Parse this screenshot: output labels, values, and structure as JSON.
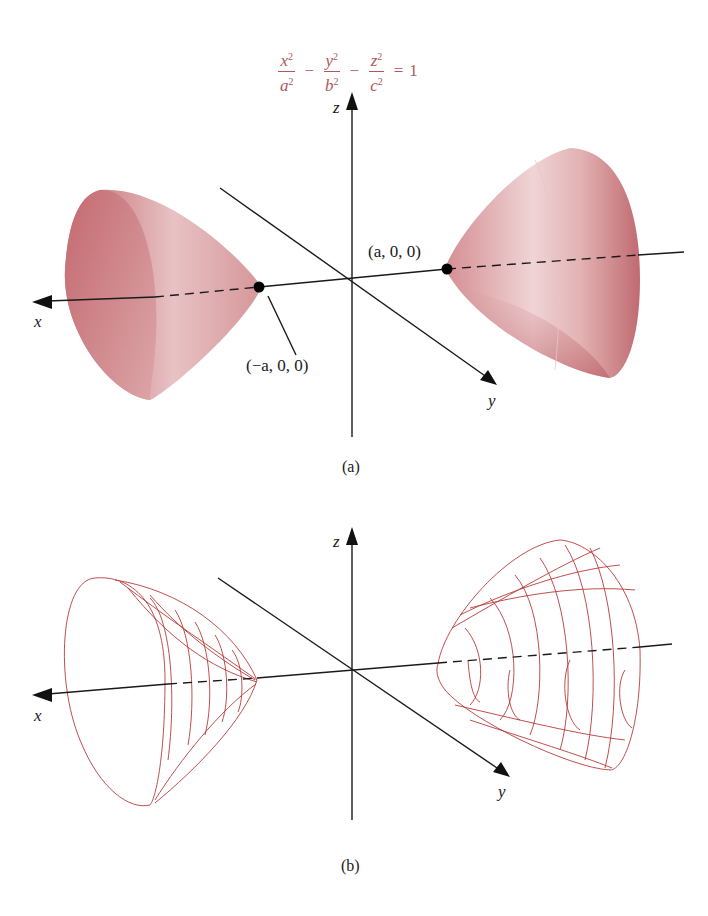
{
  "figure": {
    "equation": {
      "terms": [
        {
          "num_var": "x",
          "den_var": "a",
          "exp": "2"
        },
        {
          "num_var": "y",
          "den_var": "b",
          "exp": "2"
        },
        {
          "num_var": "z",
          "den_var": "c",
          "exp": "2"
        }
      ],
      "minus": "−",
      "equals": "=",
      "rhs": "1",
      "color": "#b0565c"
    },
    "panel_a": {
      "caption": "(a)",
      "axis_labels": {
        "x": "x",
        "y": "y",
        "z": "z"
      },
      "points": [
        {
          "label": "(a, 0, 0)"
        },
        {
          "label": "(−a, 0, 0)"
        }
      ],
      "surface_color": "#c77b80",
      "style": "shaded"
    },
    "panel_b": {
      "caption": "(b)",
      "axis_labels": {
        "x": "x",
        "y": "y",
        "z": "z"
      },
      "wire_color": "#b83a3a",
      "style": "wireframe"
    }
  }
}
